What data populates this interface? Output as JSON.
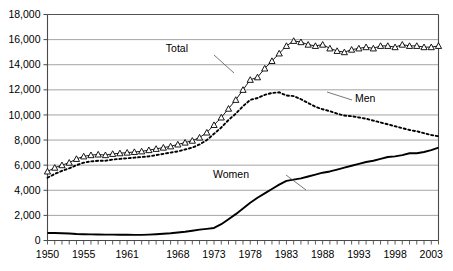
{
  "chart_data": {
    "type": "line",
    "title": "",
    "xlabel": "",
    "ylabel": "",
    "xlim": [
      1950,
      2004
    ],
    "ylim": [
      0,
      18000
    ],
    "grid": true,
    "legend_position": "inline-annotations",
    "ytick_labels": [
      "0",
      "2,000",
      "4,000",
      "6,000",
      "8,000",
      "10,000",
      "12,000",
      "14,000",
      "16,000",
      "18,000"
    ],
    "ytick_values": [
      0,
      2000,
      4000,
      6000,
      8000,
      10000,
      12000,
      14000,
      16000,
      18000
    ],
    "xtick_labels": [
      "1950",
      "1955",
      "1961",
      "1968",
      "1973",
      "1978",
      "1983",
      "1988",
      "1993",
      "1998",
      "2003"
    ],
    "xtick_values": [
      1950,
      1955,
      1961,
      1968,
      1973,
      1978,
      1983,
      1988,
      1993,
      1998,
      2003
    ],
    "minor_xticks": "every year 1950-2004",
    "annotations": [
      {
        "text": "Total",
        "series": "Total",
        "x": 188,
        "y": 52
      },
      {
        "text": "Men",
        "series": "Men",
        "x": 355,
        "y": 102
      },
      {
        "text": "Women",
        "series": "Women",
        "x": 249,
        "y": 178
      }
    ],
    "x": [
      1950,
      1951,
      1952,
      1953,
      1954,
      1955,
      1956,
      1957,
      1958,
      1959,
      1960,
      1961,
      1962,
      1963,
      1964,
      1965,
      1966,
      1967,
      1968,
      1969,
      1970,
      1971,
      1972,
      1973,
      1974,
      1975,
      1976,
      1977,
      1978,
      1979,
      1980,
      1981,
      1982,
      1983,
      1984,
      1985,
      1986,
      1987,
      1988,
      1989,
      1990,
      1991,
      1992,
      1993,
      1994,
      1995,
      1996,
      1997,
      1998,
      1999,
      2000,
      2001,
      2002,
      2003,
      2004
    ],
    "series": [
      {
        "name": "Total",
        "style": "solid-with-triangle-markers",
        "marker": "triangle-open",
        "color": "#000000",
        "values": [
          5500,
          5800,
          6000,
          6200,
          6500,
          6700,
          6800,
          6850,
          6800,
          6900,
          6950,
          7000,
          7050,
          7100,
          7200,
          7300,
          7400,
          7500,
          7650,
          7800,
          7950,
          8200,
          8600,
          9200,
          9800,
          10500,
          11200,
          12000,
          12800,
          13000,
          13700,
          14300,
          14900,
          15500,
          15900,
          15800,
          15600,
          15500,
          15600,
          15300,
          15100,
          15000,
          15200,
          15300,
          15400,
          15300,
          15500,
          15500,
          15400,
          15600,
          15500,
          15500,
          15400,
          15400,
          15500
        ]
      },
      {
        "name": "Men",
        "style": "dotted",
        "marker": "none",
        "color": "#000000",
        "values": [
          5000,
          5300,
          5550,
          5750,
          6000,
          6200,
          6300,
          6350,
          6350,
          6450,
          6500,
          6550,
          6600,
          6650,
          6700,
          6800,
          6900,
          7000,
          7100,
          7250,
          7400,
          7650,
          8000,
          8500,
          9000,
          9600,
          10100,
          10700,
          11200,
          11350,
          11600,
          11750,
          11800,
          11550,
          11500,
          11250,
          10950,
          10650,
          10450,
          10300,
          10100,
          9950,
          9900,
          9800,
          9700,
          9550,
          9400,
          9250,
          9100,
          8950,
          8800,
          8700,
          8550,
          8400,
          8300
        ]
      },
      {
        "name": "Women",
        "style": "solid-thick",
        "marker": "none",
        "color": "#000000",
        "values": [
          600,
          600,
          580,
          560,
          520,
          500,
          490,
          480,
          470,
          470,
          460,
          460,
          450,
          450,
          470,
          500,
          540,
          580,
          640,
          700,
          780,
          870,
          930,
          1000,
          1300,
          1700,
          2100,
          2550,
          3000,
          3400,
          3750,
          4100,
          4450,
          4750,
          4850,
          4950,
          5100,
          5250,
          5400,
          5500,
          5650,
          5800,
          5950,
          6100,
          6250,
          6350,
          6500,
          6650,
          6700,
          6800,
          6950,
          6950,
          7050,
          7200,
          7400
        ]
      }
    ]
  }
}
